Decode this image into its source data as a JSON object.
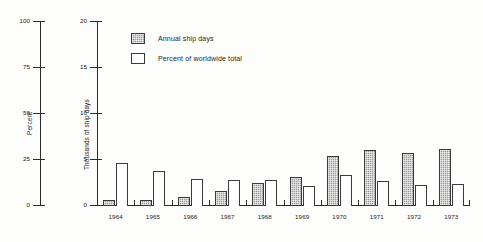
{
  "chart_data": {
    "type": "bar",
    "title": "",
    "xlabel": "",
    "categories": [
      "1964",
      "1965",
      "1966",
      "1967",
      "1968",
      "1969",
      "1970",
      "1971",
      "1972",
      "1973"
    ],
    "series": [
      {
        "name": "Annual ship days",
        "axis": "right",
        "ylabel": "Thousands of ship days",
        "values": [
          0.6,
          0.7,
          1.0,
          1.6,
          2.5,
          3.1,
          5.4,
          6.1,
          5.7,
          6.2
        ]
      },
      {
        "name": "Percent of worldwide total",
        "axis": "left",
        "ylabel": "Percent",
        "values": [
          23.5,
          19.0,
          14.5,
          14.0,
          14.0,
          11.0,
          17.0,
          13.5,
          11.5,
          12.0
        ]
      }
    ],
    "left_axis": {
      "label": "Percent",
      "ticks": [
        "0",
        "25",
        "50",
        "75",
        "100"
      ],
      "tick_values": [
        0,
        25,
        50,
        75,
        100
      ],
      "ylim": [
        0,
        100
      ]
    },
    "right_axis": {
      "label": "Thousands of ship days",
      "ticks": [
        "0",
        "5",
        "10",
        "15",
        "20"
      ],
      "tick_values": [
        0,
        5,
        10,
        15,
        20
      ],
      "ylim": [
        0,
        20
      ]
    },
    "grid": false,
    "legend_position": "upper-left-inside"
  },
  "legend": {
    "items": [
      {
        "label": "Annual ship days",
        "style": "shaded",
        "color": "#9a9a9a"
      },
      {
        "label": "Percent of worldwide total",
        "style": "open",
        "color": "#ffffff"
      }
    ]
  },
  "axes": {
    "percent": {
      "title": "Percent",
      "labels": [
        "100",
        "75",
        "50",
        "25",
        "0"
      ]
    },
    "ship_days": {
      "title": "Thousands of ship days",
      "labels": [
        "20",
        "15",
        "10",
        "5",
        "0"
      ]
    }
  },
  "xaxis": {
    "labels": [
      "1964",
      "1965",
      "1966",
      "1967",
      "1968",
      "1969",
      "1970",
      "1971",
      "1972",
      "1973"
    ]
  },
  "colors": {
    "shaded_bar": "#9a9a9a",
    "open_bar": "#ffffff",
    "outline": "#3a3a3a",
    "axis": "#2b2b2b",
    "background": "#fdfdfb"
  }
}
